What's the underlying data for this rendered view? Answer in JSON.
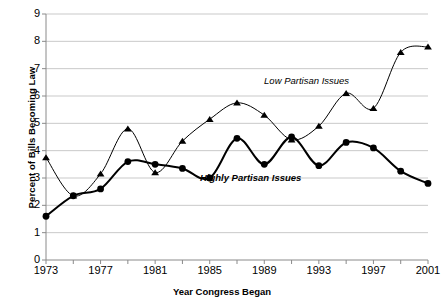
{
  "chart_data": {
    "type": "line",
    "title": "",
    "xlabel": "Year Congress Began",
    "ylabel": "Percent of Bills Becoming Law",
    "xlim": [
      1973,
      2001
    ],
    "ylim": [
      0,
      9
    ],
    "ytick_step": 1,
    "xtick_step": 2,
    "grid": "horizontal",
    "legend_position": "inline-annotations",
    "x": [
      1973,
      1975,
      1977,
      1979,
      1981,
      1983,
      1985,
      1987,
      1989,
      1991,
      1993,
      1995,
      1997,
      1999,
      2001
    ],
    "xtick_labels": [
      "1973",
      "1977",
      "1981",
      "1985",
      "1989",
      "1993",
      "1997",
      "2001"
    ],
    "ytick_labels": [
      "0",
      "1",
      "2",
      "3",
      "4",
      "5",
      "6",
      "7",
      "8",
      "9"
    ],
    "series": [
      {
        "name": "Low Partisan Issues",
        "marker": "triangle",
        "line_width": 1,
        "color": "#000000",
        "values": [
          3.75,
          2.35,
          3.15,
          4.8,
          3.2,
          4.35,
          5.15,
          5.75,
          5.3,
          4.4,
          4.9,
          6.1,
          5.55,
          7.6,
          7.8
        ]
      },
      {
        "name": "Highly Partisan Issues",
        "marker": "circle",
        "line_width": 2,
        "color": "#000000",
        "values": [
          1.6,
          2.35,
          2.6,
          3.6,
          3.5,
          3.35,
          3.0,
          4.45,
          3.5,
          4.5,
          3.45,
          4.3,
          4.1,
          3.25,
          2.8
        ]
      }
    ],
    "annotations": [
      {
        "text": "Low Partisan Issues",
        "x": 1992.1,
        "y": 6.55,
        "style": "italic"
      },
      {
        "text": "Highly Partisan Issues",
        "x": 1988.0,
        "y": 3.0,
        "style": "italic-bold"
      }
    ]
  }
}
